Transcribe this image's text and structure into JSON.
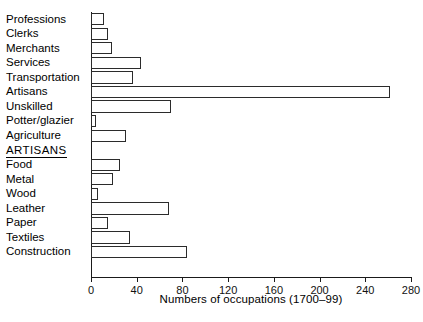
{
  "chart_data": {
    "type": "bar",
    "orientation": "horizontal",
    "title": "",
    "xlabel": "Numbers of occupations (1700–99)",
    "ylabel": "",
    "xlim": [
      0,
      280
    ],
    "xticks": [
      0,
      40,
      80,
      120,
      160,
      200,
      240,
      280
    ],
    "xtick_labels": [
      "0",
      "40",
      "80",
      "120",
      "160",
      "200",
      "240",
      "280"
    ],
    "grid": false,
    "legend": null,
    "section_header": "ARTISANS",
    "categories": [
      "Professions",
      "Clerks",
      "Merchants",
      "Services",
      "Transportation",
      "Artisans",
      "Unskilled",
      "Potter/glazier",
      "Agriculture",
      "Food",
      "Metal",
      "Wood",
      "Leather",
      "Paper",
      "Textiles",
      "Construction"
    ],
    "values": [
      11,
      15,
      18,
      44,
      37,
      262,
      70,
      4,
      31,
      25,
      19,
      6,
      68,
      15,
      34,
      84
    ],
    "groups": [
      {
        "name": "All occupations",
        "categories": [
          "Professions",
          "Clerks",
          "Merchants",
          "Services",
          "Transportation",
          "Artisans",
          "Unskilled",
          "Potter/glazier",
          "Agriculture"
        ],
        "values": [
          11,
          15,
          18,
          44,
          37,
          262,
          70,
          4,
          31
        ]
      },
      {
        "name": "ARTISANS",
        "categories": [
          "Food",
          "Metal",
          "Wood",
          "Leather",
          "Paper",
          "Textiles",
          "Construction"
        ],
        "values": [
          25,
          19,
          6,
          68,
          15,
          34,
          84
        ]
      }
    ],
    "colors": {
      "bar_fill": "#ffffff",
      "bar_stroke": "#2b2b2b",
      "axis": "#1a1a1a",
      "text": "#000000",
      "background": "#ffffff"
    }
  }
}
